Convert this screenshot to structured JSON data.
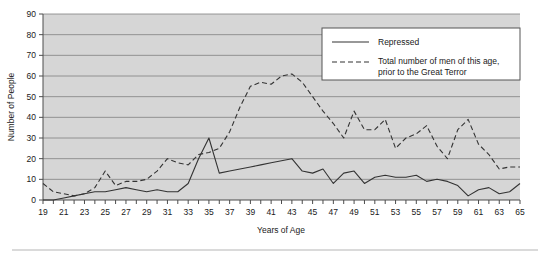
{
  "figure": {
    "background_color": "#ffffff",
    "plot_background_color": "#d6d6d6",
    "gridline_color": "#808080",
    "axis_color": "#4d4d4d",
    "series_color": "#333333",
    "bottom_rule_color": "#b5b5b5"
  },
  "chart_data": {
    "type": "line",
    "title": "",
    "xlabel": "Years of Age",
    "ylabel": "Number of People",
    "xlim": [
      19,
      65
    ],
    "ylim": [
      0,
      90
    ],
    "ytick_step": 10,
    "yticks": [
      0,
      10,
      20,
      30,
      40,
      50,
      60,
      70,
      80,
      90
    ],
    "xticks": [
      19,
      20,
      21,
      22,
      23,
      24,
      25,
      26,
      27,
      28,
      29,
      30,
      31,
      32,
      33,
      34,
      35,
      36,
      37,
      38,
      39,
      40,
      41,
      42,
      43,
      44,
      45,
      46,
      47,
      48,
      49,
      50,
      51,
      52,
      53,
      54,
      55,
      56,
      57,
      58,
      59,
      60,
      61,
      62,
      63,
      64,
      65
    ],
    "xtick_labels_shown": [
      19,
      21,
      23,
      25,
      27,
      29,
      31,
      33,
      35,
      37,
      39,
      41,
      43,
      45,
      47,
      49,
      51,
      53,
      55,
      57,
      59,
      61,
      63,
      65
    ],
    "grid": true,
    "grid_axis": "y",
    "legend_position": "top-right",
    "x": [
      19,
      20,
      21,
      22,
      23,
      24,
      25,
      26,
      27,
      28,
      29,
      30,
      31,
      32,
      33,
      34,
      35,
      36,
      37,
      38,
      39,
      40,
      41,
      42,
      43,
      44,
      45,
      46,
      47,
      48,
      49,
      50,
      51,
      52,
      53,
      54,
      55,
      56,
      57,
      58,
      59,
      60,
      61,
      62,
      63,
      64,
      65
    ],
    "series": [
      {
        "name": "Repressed",
        "style": "solid",
        "values": [
          0,
          0,
          1,
          2,
          3,
          4,
          4,
          5,
          6,
          5,
          4,
          5,
          4,
          4,
          8,
          20,
          30,
          13,
          14,
          15,
          16,
          17,
          18,
          19,
          20,
          14,
          13,
          15,
          8,
          13,
          14,
          8,
          11,
          12,
          11,
          11,
          12,
          9,
          10,
          9,
          7,
          2,
          5,
          6,
          3,
          4,
          8
        ]
      },
      {
        "name": "Total number of men of this age, prior to the Great Terror",
        "style": "dashed",
        "values": [
          8,
          4,
          3,
          2,
          3,
          6,
          14,
          7,
          9,
          9,
          10,
          14,
          20,
          18,
          17,
          22,
          23,
          25,
          33,
          45,
          55,
          57,
          56,
          60,
          61,
          57,
          50,
          43,
          37,
          30,
          43,
          34,
          34,
          39,
          25,
          30,
          32,
          36,
          26,
          20,
          34,
          39,
          27,
          22,
          15,
          16,
          16
        ]
      }
    ],
    "series_right_tail": {
      "note": "dashed series continues: ages 56-65 values [24, 20, 16, 15, 15, 15, 11, 10, 12, 12]"
    }
  },
  "legend": {
    "entries": [
      {
        "label": "Repressed",
        "style": "solid"
      },
      {
        "label": "Total number of men of this age,",
        "label2": "prior to the Great Terror",
        "style": "dashed"
      }
    ]
  },
  "axis_titles": {
    "x": "Years of Age",
    "y": "Number of People"
  }
}
